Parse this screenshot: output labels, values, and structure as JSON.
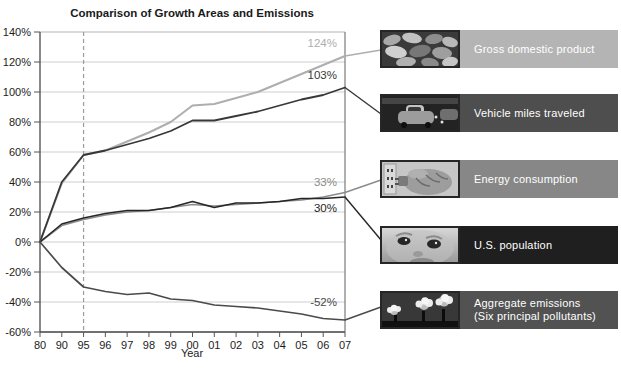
{
  "chart_data": {
    "type": "line",
    "title": "Comparison of Growth Areas and Emissions",
    "xlabel": "Year",
    "ylim": [
      -60,
      140
    ],
    "grid": true,
    "legend_position": "right",
    "reference_year": "95",
    "categories": [
      "80",
      "90",
      "95",
      "96",
      "97",
      "98",
      "99",
      "00",
      "01",
      "02",
      "03",
      "04",
      "05",
      "06",
      "07"
    ],
    "y_ticks": [
      "140%",
      "120%",
      "100%",
      "80%",
      "60%",
      "40%",
      "20%",
      "0%",
      "-20%",
      "-40%",
      "-60%"
    ],
    "series": [
      {
        "id": "gdp",
        "name": "Gross domestic product",
        "color": "#aeaeae",
        "width": 2,
        "end_label": "124%",
        "label_dy": -9,
        "values": [
          0,
          39,
          58,
          61,
          67,
          73,
          80,
          91,
          92,
          96,
          100,
          106,
          112,
          118,
          124
        ]
      },
      {
        "id": "vmt",
        "name": "Vehicle miles traveled",
        "color": "#383838",
        "width": 1.8,
        "end_label": "103%",
        "label_dy": -9,
        "values": [
          0,
          40,
          58,
          61,
          65,
          69,
          74,
          81,
          81,
          84,
          87,
          91,
          95,
          98,
          103
        ]
      },
      {
        "id": "energy",
        "name": "Energy consumption",
        "color": "#8c8c8c",
        "width": 1.6,
        "end_label": "33%",
        "label_dy": -7,
        "values": [
          0,
          11,
          15,
          18,
          20,
          21,
          23,
          25,
          24,
          25,
          26,
          27,
          28,
          30,
          33
        ]
      },
      {
        "id": "population",
        "name": "U.S. population",
        "color": "#262626",
        "width": 1.6,
        "end_label": "30%",
        "label_dy": 15,
        "values": [
          0,
          12,
          16,
          19,
          21,
          21,
          23,
          27,
          23,
          26,
          26,
          27,
          29,
          29,
          30
        ]
      },
      {
        "id": "emissions",
        "name": "Aggregate emissions (Six principal pollutants)",
        "color": "#4a4a4a",
        "width": 1.7,
        "end_label": "-52%",
        "label_dy": -14,
        "values": [
          0,
          -17,
          -30,
          -33,
          -35,
          -34,
          -38,
          -39,
          -42,
          -43,
          -44,
          -46,
          -48,
          -51,
          -52
        ]
      }
    ]
  },
  "legend": {
    "items": [
      {
        "label": "Gross domestic product",
        "label2": "",
        "bg": "#b4b4b4",
        "thumb": "coins"
      },
      {
        "label": "Vehicle miles traveled",
        "label2": "",
        "bg": "#4e4e4e",
        "thumb": "traffic"
      },
      {
        "label": "Energy consumption",
        "label2": "",
        "bg": "#878787",
        "thumb": "plug"
      },
      {
        "label": "U.S. population",
        "label2": "",
        "bg": "#1f1f1f",
        "thumb": "baby"
      },
      {
        "label": "Aggregate emissions",
        "label2": "(Six principal pollutants)",
        "bg": "#525252",
        "thumb": "smokestacks"
      }
    ]
  }
}
